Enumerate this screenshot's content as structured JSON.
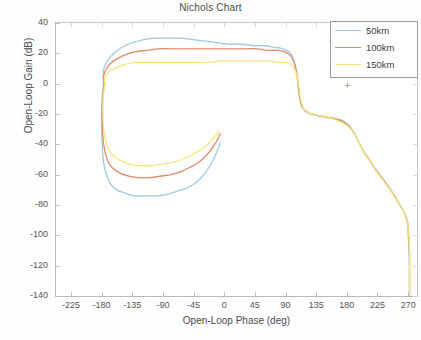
{
  "figure": {
    "title": "Nichols Chart",
    "background": "#ffffff"
  },
  "axes": {
    "xlabel": "Open-Loop Phase (deg)",
    "ylabel": "Open-Loop Gain (dB)",
    "xticks": [
      "-225",
      "-180",
      "-135",
      "-90",
      "-45",
      "0",
      "45",
      "90",
      "135",
      "180",
      "225",
      "270"
    ],
    "yticks": [
      "40",
      "20",
      "0",
      "-20",
      "-40",
      "-60",
      "-80",
      "-100",
      "-120",
      "-140"
    ]
  },
  "legend": {
    "position": "top-right",
    "entries": [
      {
        "label": "50km",
        "color": "#9fc9e8"
      },
      {
        "label": "100km",
        "color": "#e08a68"
      },
      {
        "label": "150km",
        "color": "#f2e87a"
      }
    ]
  },
  "marker": {
    "glyph": "+",
    "color": "#c08878"
  },
  "chart_data": {
    "type": "line",
    "title": "Nichols Chart",
    "xlabel": "Open-Loop Phase (deg)",
    "ylabel": "Open-Loop Gain (dB)",
    "xlim": [
      -247,
      283
    ],
    "ylim": [
      -140,
      40
    ],
    "xticks": [
      -225,
      -180,
      -135,
      -90,
      -45,
      0,
      45,
      90,
      135,
      180,
      225,
      270
    ],
    "yticks": [
      40,
      20,
      0,
      -20,
      -40,
      -60,
      -80,
      -100,
      -120,
      -140
    ],
    "grid": false,
    "legend_position": "upper right",
    "series": [
      {
        "name": "50km",
        "color": "#9fc9e8",
        "points": [
          [
            -177,
            0
          ],
          [
            -178,
            6
          ],
          [
            -176,
            11
          ],
          [
            -170,
            16
          ],
          [
            -162,
            20
          ],
          [
            -150,
            24
          ],
          [
            -135,
            27
          ],
          [
            -118,
            29
          ],
          [
            -100,
            30
          ],
          [
            -82,
            30
          ],
          [
            -64,
            30
          ],
          [
            -46,
            29
          ],
          [
            -28,
            28
          ],
          [
            -10,
            27
          ],
          [
            8,
            26
          ],
          [
            26,
            26
          ],
          [
            44,
            25
          ],
          [
            60,
            25
          ],
          [
            74,
            24
          ],
          [
            86,
            23
          ],
          [
            95,
            21
          ],
          [
            101,
            17
          ],
          [
            105,
            10
          ],
          [
            108,
            0
          ],
          [
            110,
            -8
          ],
          [
            113,
            -14
          ],
          [
            118,
            -18
          ],
          [
            126,
            -20
          ],
          [
            136,
            -21
          ],
          [
            148,
            -22
          ],
          [
            160,
            -23
          ],
          [
            172,
            -24
          ],
          [
            182,
            -27
          ],
          [
            190,
            -32
          ],
          [
            197,
            -38
          ],
          [
            204,
            -44
          ],
          [
            212,
            -50
          ],
          [
            220,
            -55
          ],
          [
            230,
            -61
          ],
          [
            240,
            -67
          ],
          [
            250,
            -74
          ],
          [
            258,
            -80
          ],
          [
            264,
            -85
          ],
          [
            268,
            -90
          ],
          [
            270,
            -99
          ],
          [
            271,
            -110
          ],
          [
            272,
            -122
          ],
          [
            272,
            -134
          ],
          [
            272,
            -140
          ]
        ]
      },
      {
        "name": "50km-return",
        "color": "#9fc9e8",
        "points": [
          [
            -177,
            0
          ],
          [
            -179,
            -8
          ],
          [
            -180,
            -18
          ],
          [
            -180,
            -30
          ],
          [
            -179,
            -42
          ],
          [
            -177,
            -52
          ],
          [
            -173,
            -60
          ],
          [
            -167,
            -66
          ],
          [
            -158,
            -70
          ],
          [
            -146,
            -72
          ],
          [
            -132,
            -74
          ],
          [
            -116,
            -74
          ],
          [
            -100,
            -74
          ],
          [
            -84,
            -73
          ],
          [
            -70,
            -71
          ],
          [
            -56,
            -69
          ],
          [
            -44,
            -66
          ],
          [
            -34,
            -62
          ],
          [
            -25,
            -57
          ],
          [
            -18,
            -52
          ],
          [
            -12,
            -46
          ],
          [
            -8,
            -42
          ],
          [
            -6,
            -39
          ]
        ]
      },
      {
        "name": "100km",
        "color": "#e08a68",
        "points": [
          [
            -176,
            0
          ],
          [
            -177,
            5
          ],
          [
            -174,
            9
          ],
          [
            -168,
            13
          ],
          [
            -159,
            16
          ],
          [
            -146,
            19
          ],
          [
            -131,
            21
          ],
          [
            -114,
            22
          ],
          [
            -96,
            23
          ],
          [
            -78,
            23
          ],
          [
            -60,
            23
          ],
          [
            -42,
            23
          ],
          [
            -24,
            23
          ],
          [
            -6,
            23
          ],
          [
            12,
            23
          ],
          [
            30,
            23
          ],
          [
            48,
            23
          ],
          [
            64,
            22
          ],
          [
            78,
            22
          ],
          [
            89,
            21
          ],
          [
            96,
            19
          ],
          [
            102,
            15
          ],
          [
            106,
            8
          ],
          [
            109,
            -1
          ],
          [
            111,
            -9
          ],
          [
            114,
            -15
          ],
          [
            120,
            -18
          ],
          [
            128,
            -20
          ],
          [
            138,
            -21
          ],
          [
            150,
            -22
          ],
          [
            162,
            -23
          ],
          [
            174,
            -25
          ],
          [
            183,
            -28
          ],
          [
            191,
            -33
          ],
          [
            198,
            -39
          ],
          [
            205,
            -45
          ],
          [
            213,
            -50
          ],
          [
            221,
            -56
          ],
          [
            231,
            -62
          ],
          [
            241,
            -68
          ],
          [
            251,
            -75
          ],
          [
            259,
            -81
          ],
          [
            265,
            -86
          ],
          [
            269,
            -91
          ],
          [
            271,
            -100
          ],
          [
            272,
            -111
          ],
          [
            272,
            -123
          ],
          [
            272,
            -135
          ],
          [
            272,
            -140
          ]
        ]
      },
      {
        "name": "100km-return",
        "color": "#e08a68",
        "points": [
          [
            -176,
            0
          ],
          [
            -178,
            -7
          ],
          [
            -179,
            -16
          ],
          [
            -179,
            -26
          ],
          [
            -178,
            -36
          ],
          [
            -175,
            -45
          ],
          [
            -170,
            -52
          ],
          [
            -163,
            -56
          ],
          [
            -153,
            -59
          ],
          [
            -140,
            -61
          ],
          [
            -126,
            -62
          ],
          [
            -110,
            -62
          ],
          [
            -94,
            -61
          ],
          [
            -78,
            -60
          ],
          [
            -64,
            -58
          ],
          [
            -50,
            -55
          ],
          [
            -38,
            -52
          ],
          [
            -28,
            -48
          ],
          [
            -20,
            -44
          ],
          [
            -14,
            -40
          ],
          [
            -9,
            -36
          ],
          [
            -6,
            -33
          ]
        ]
      },
      {
        "name": "150km",
        "color": "#f2e87a",
        "points": [
          [
            -175,
            0
          ],
          [
            -176,
            3
          ],
          [
            -173,
            6
          ],
          [
            -166,
            9
          ],
          [
            -156,
            11
          ],
          [
            -143,
            13
          ],
          [
            -128,
            14
          ],
          [
            -111,
            14
          ],
          [
            -93,
            14
          ],
          [
            -75,
            14
          ],
          [
            -57,
            14
          ],
          [
            -39,
            14
          ],
          [
            -21,
            14
          ],
          [
            -3,
            15
          ],
          [
            15,
            15
          ],
          [
            33,
            15
          ],
          [
            51,
            15
          ],
          [
            66,
            15
          ],
          [
            79,
            14
          ],
          [
            90,
            14
          ],
          [
            97,
            13
          ],
          [
            103,
            10
          ],
          [
            107,
            4
          ],
          [
            110,
            -3
          ],
          [
            112,
            -10
          ],
          [
            116,
            -16
          ],
          [
            122,
            -19
          ],
          [
            130,
            -20
          ],
          [
            140,
            -21
          ],
          [
            152,
            -22
          ],
          [
            164,
            -24
          ],
          [
            175,
            -26
          ],
          [
            184,
            -29
          ],
          [
            192,
            -34
          ],
          [
            199,
            -40
          ],
          [
            206,
            -46
          ],
          [
            214,
            -51
          ],
          [
            222,
            -57
          ],
          [
            232,
            -63
          ],
          [
            242,
            -69
          ],
          [
            252,
            -76
          ],
          [
            260,
            -82
          ],
          [
            266,
            -87
          ],
          [
            269,
            -92
          ],
          [
            271,
            -101
          ],
          [
            272,
            -112
          ],
          [
            272,
            -124
          ],
          [
            272,
            -136
          ],
          [
            272,
            -140
          ]
        ]
      },
      {
        "name": "150km-return",
        "color": "#f2e87a",
        "points": [
          [
            -175,
            0
          ],
          [
            -177,
            -6
          ],
          [
            -178,
            -13
          ],
          [
            -178,
            -21
          ],
          [
            -177,
            -30
          ],
          [
            -174,
            -38
          ],
          [
            -169,
            -44
          ],
          [
            -161,
            -48
          ],
          [
            -151,
            -51
          ],
          [
            -138,
            -53
          ],
          [
            -124,
            -54
          ],
          [
            -108,
            -54
          ],
          [
            -92,
            -53
          ],
          [
            -76,
            -52
          ],
          [
            -62,
            -50
          ],
          [
            -48,
            -47
          ],
          [
            -36,
            -44
          ],
          [
            -26,
            -41
          ],
          [
            -18,
            -37
          ],
          [
            -12,
            -34
          ],
          [
            -7,
            -31
          ]
        ]
      }
    ]
  }
}
